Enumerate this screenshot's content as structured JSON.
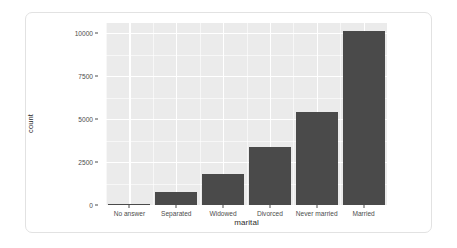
{
  "chart_data": {
    "type": "bar",
    "title": "",
    "subtitle": "",
    "xlabel": "marital",
    "ylabel": "count",
    "categories": [
      "No answer",
      "Separated",
      "Widowed",
      "Divorced",
      "Never married",
      "Married"
    ],
    "values": [
      17,
      743,
      1807,
      3383,
      5416,
      10117
    ],
    "ylim": [
      0,
      10600
    ],
    "yticks": [
      0,
      2500,
      5000,
      7500,
      10000
    ],
    "ytick_labels": [
      "0",
      "2500",
      "5000",
      "7500",
      "10000"
    ],
    "y_minor_ticks": [
      1250,
      3750,
      6250,
      8750
    ],
    "grid": true,
    "legend": "none",
    "bar_color": "#4a4a4a",
    "panel_color": "#ebebeb",
    "gridline_color": "#ffffff",
    "axis_text_color": "#4d4d4d"
  },
  "card": {
    "background": "#ffffff",
    "border_color": "#e2e2e2"
  }
}
